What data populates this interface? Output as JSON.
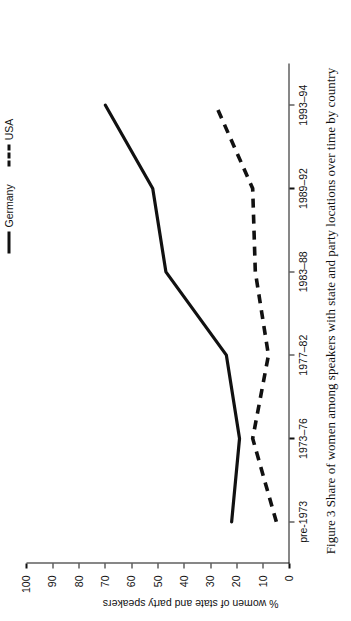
{
  "figure": {
    "caption": "Figure 3  Share of women among speakers with state and party locations over time by country"
  },
  "legend": {
    "position": "top-right",
    "items": [
      {
        "label": "Germany",
        "style": "solid",
        "color": "#111111"
      },
      {
        "label": "USA",
        "style": "dashed",
        "color": "#111111"
      }
    ]
  },
  "axes": {
    "y_title": "% women of state and party speakers",
    "y_ticks": [
      "0",
      "10",
      "20",
      "30",
      "40",
      "50",
      "60",
      "70",
      "80",
      "90",
      "100"
    ],
    "x_ticks": [
      "pre-1973",
      "1973–76",
      "1977–82",
      "1983–88",
      "1989–92",
      "1993–94"
    ]
  },
  "chart_data": {
    "type": "line",
    "title": "",
    "xlabel": "",
    "ylabel": "% women of state and party speakers",
    "categories": [
      "pre-1973",
      "1973–76",
      "1977–82",
      "1983–88",
      "1989–92",
      "1993–94"
    ],
    "series": [
      {
        "name": "Germany",
        "style": "solid",
        "color": "#111111",
        "values": [
          22,
          19,
          24,
          47,
          52,
          70
        ]
      },
      {
        "name": "USA",
        "style": "dashed",
        "color": "#111111",
        "values": [
          5,
          14,
          8,
          13,
          14,
          28
        ]
      }
    ],
    "ylim": [
      0,
      100
    ],
    "ytick_step": 10,
    "grid": false,
    "legend_position": "top-right"
  }
}
